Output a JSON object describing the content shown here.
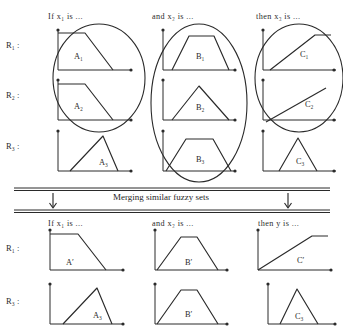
{
  "figure": {
    "title_top_headers": {
      "col1": "If  x₁  is ...",
      "col2": "and  x₂  is ...",
      "col3": "then  x₃  is ..."
    },
    "title_bottom_headers": {
      "col1": "If  x₁  is ...",
      "col2": "and  x₂  is ...",
      "col3": "then  y  is ..."
    },
    "band_label": "Merging similar fuzzy sets",
    "band_arrow_left": "↓",
    "band_arrow_right": "↓",
    "top_rows": [
      {
        "label": "R₁ :",
        "cells": [
          {
            "set": "A₁",
            "shape": "trapezoid-right-descending"
          },
          {
            "set": "B₁",
            "shape": "trapezoid-symmetric"
          },
          {
            "set": "C₁",
            "shape": "ramp-rising-saturating"
          }
        ]
      },
      {
        "label": "R₂ :",
        "cells": [
          {
            "set": "A₂",
            "shape": "trapezoid-right-descending"
          },
          {
            "set": "B₂",
            "shape": "triangle-symmetric"
          },
          {
            "set": "C₂",
            "shape": "ramp-rising-line"
          }
        ]
      },
      {
        "label": "R₃ :",
        "cells": [
          {
            "set": "A₃",
            "shape": "triangle-right-peak"
          },
          {
            "set": "B₃",
            "shape": "trapezoid-symmetric"
          },
          {
            "set": "C₃",
            "shape": "triangle-left-peak"
          }
        ]
      }
    ],
    "bottom_rows": [
      {
        "label": "R₁ :",
        "cells": [
          {
            "set": "A′",
            "shape": "trapezoid-right-descending"
          },
          {
            "set": "B′",
            "shape": "trapezoid-narrow-top"
          },
          {
            "set": "C′",
            "shape": "ramp-rising-saturating"
          }
        ]
      },
      {
        "label": "R₃ :",
        "cells": [
          {
            "set": "A₃",
            "shape": "triangle-right-peak"
          },
          {
            "set": "B′",
            "shape": "trapezoid-narrow-top"
          },
          {
            "set": "C₃",
            "shape": "triangle-left-peak"
          }
        ]
      }
    ],
    "groupings": [
      {
        "column": "A",
        "encircles": [
          "A₁",
          "A₂"
        ],
        "merges_to": "A′"
      },
      {
        "column": "B",
        "encircles": [
          "B₁",
          "B₂",
          "B₃"
        ],
        "merges_to": "B′"
      },
      {
        "column": "C",
        "encircles": [
          "C₁",
          "C₂"
        ],
        "merges_to": "C′"
      }
    ],
    "colors": {
      "ink": "#2a2a2a",
      "background": "#ffffff"
    }
  }
}
